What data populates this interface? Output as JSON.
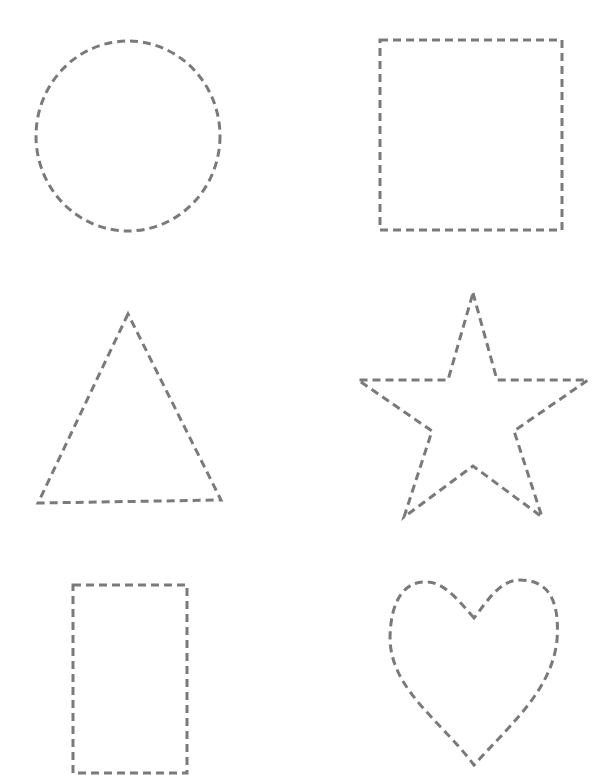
{
  "page": {
    "background": "#ffffff",
    "stroke_color": "#7a7a7a"
  },
  "shapes": [
    {
      "name": "circle",
      "cx": 128,
      "cy": 136,
      "rx": 92,
      "ry": 95
    },
    {
      "name": "square",
      "x": 380,
      "y": 40,
      "width": 182,
      "height": 190
    },
    {
      "name": "triangle",
      "points": "128,314 38,503 221,500"
    },
    {
      "name": "star",
      "points": "473,293 497,380 588,380 514,431 542,517 473,466 404,517 432,431 358,380 448,380"
    },
    {
      "name": "rectangle",
      "x": 73,
      "y": 585,
      "width": 114,
      "height": 188
    },
    {
      "name": "heart",
      "path": "M474,618 C460,602 445,583 428,582 C405,580 390,600 390,640 C392,690 440,720 474,765 C510,725 552,690 557,640 C560,600 548,580 520,580 C500,580 488,600 474,618 Z"
    }
  ]
}
